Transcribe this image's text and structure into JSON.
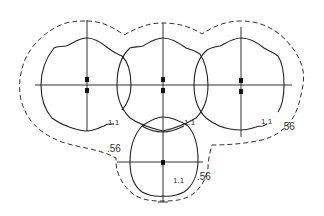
{
  "diagram": {
    "type": "isofootcandle-plot",
    "colors": {
      "line": "#333333",
      "marker": "#111111",
      "background": "#ffffff"
    },
    "contours": [
      {
        "name": "inner-contour",
        "value_label": "1.1",
        "style": "solid"
      },
      {
        "name": "outer-contour",
        "value_label": ".56",
        "style": "dashed"
      }
    ],
    "fixtures": [
      {
        "id": "left",
        "center": [
          87,
          85
        ]
      },
      {
        "id": "middle",
        "center": [
          163,
          85
        ]
      },
      {
        "id": "right",
        "center": [
          241,
          85
        ]
      },
      {
        "id": "bottom",
        "center": [
          163,
          162
        ]
      }
    ],
    "labels": {
      "left_inner": "1.1",
      "middle_inner": "1.1",
      "right_inner": "1.1",
      "bottom_inner": "1.1",
      "right_outer": ".56",
      "bottom_left_outer": ".56",
      "bottom_right_outer": ".56"
    }
  }
}
